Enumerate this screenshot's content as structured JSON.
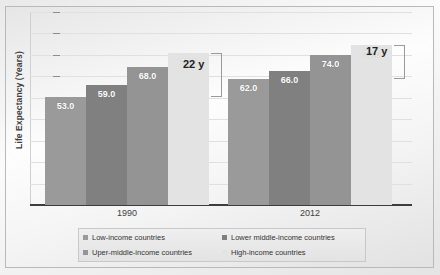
{
  "chart_data": {
    "type": "bar",
    "title": "",
    "subtitle": "",
    "xlabel": "",
    "ylabel": "Life Expectancy (Years)",
    "categories": [
      "1990",
      "2012"
    ],
    "ylim": [
      0,
      95
    ],
    "grid": true,
    "legend_position": "bottom",
    "series": [
      {
        "name": "Low-income countries",
        "values": [
          53.0,
          62.0
        ],
        "color": "#9a9a9a",
        "label_color": "#ffffff"
      },
      {
        "name": "Lower middle-income countries",
        "values": [
          59.0,
          66.0
        ],
        "color": "#808080",
        "label_color": "#ffffff"
      },
      {
        "name": "Uper-middle-income countries",
        "values": [
          68.0,
          74.0
        ],
        "color": "#949494",
        "label_color": "#ffffff"
      },
      {
        "name": "High-income countries",
        "values": [
          75.0,
          79.0
        ],
        "color": "#e3e3e3",
        "label_color": "#f2f2f2"
      }
    ],
    "value_labels": [
      {
        "text": "53.0"
      },
      {
        "text": "59.0"
      },
      {
        "text": "68.0"
      },
      {
        "text": "75.0"
      },
      {
        "text": "62.0"
      },
      {
        "text": "66.0"
      },
      {
        "text": "74.0"
      },
      {
        "text": "79.0"
      }
    ],
    "annotations": [
      {
        "name": "gap-bracket-1990",
        "text": "22 y",
        "group": "1990",
        "from": 53.0,
        "to": 75.0
      },
      {
        "name": "gap-bracket-2012",
        "text": "17 y",
        "group": "2012",
        "from": 62.0,
        "to": 79.0
      }
    ]
  },
  "axis": {
    "y_label": "Life Expectancy (Years)",
    "x_tick_labels": [
      "1990",
      "2012"
    ]
  },
  "legend": {
    "items": [
      {
        "label": "Low-income countries",
        "color": "#9a9a9a"
      },
      {
        "label": "Lower middle-income countries",
        "color": "#808080"
      },
      {
        "label": "Uper-middle-income countries",
        "color": "#949494"
      },
      {
        "label": "High-income countries",
        "color": "#e3e3e3"
      }
    ]
  }
}
